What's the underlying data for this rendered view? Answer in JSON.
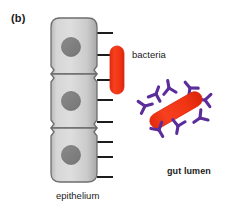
{
  "figure": {
    "panel_letter": "(b)",
    "width": 230,
    "height": 211,
    "background_color": "#FFFFFF"
  },
  "labels": {
    "panel": "(b)",
    "bacteria": "bacteria",
    "gut_lumen": "gut lumen",
    "epithelium": "epithelium"
  },
  "colors": {
    "cell_fill_light": "#E2E2E2",
    "cell_fill_mid": "#C9C9C9",
    "cell_fill_dark": "#AFAFAF",
    "cell_outline": "#6E6E6E",
    "nucleus": "#7E7E7E",
    "nucleus_outline": "#6A6A6A",
    "bacteria_red": "#F23A18",
    "bacteria_red_edge": "#E02A10",
    "antibody_purple": "#5B2D9B",
    "microvilli": "#1C1C1C",
    "text": "#1A1A1A"
  },
  "epithelium": {
    "description": "column of three stacked epithelial cells",
    "cell_count": 3,
    "column": {
      "x": 49,
      "y": 18,
      "width": 48,
      "height": 164
    },
    "cells": [
      {
        "index": 1,
        "y_top": 18,
        "y_bottom": 74,
        "nucleus": {
          "cx": 71,
          "cy": 47,
          "r": 9.5
        }
      },
      {
        "index": 2,
        "y_top": 74,
        "y_bottom": 128,
        "nucleus": {
          "cx": 71,
          "cy": 101,
          "r": 9.5
        }
      },
      {
        "index": 3,
        "y_top": 128,
        "y_bottom": 182,
        "nucleus": {
          "cx": 71,
          "cy": 155,
          "r": 9.5
        }
      }
    ],
    "microvilli": {
      "count": 8,
      "x_start": 97,
      "x_end": 113,
      "y_positions": [
        33,
        55,
        80,
        100,
        122,
        142,
        157,
        177
      ],
      "stroke_width": 2
    }
  },
  "adherent_bacterium": {
    "shape": "vertical rod / capsule",
    "x": 110,
    "y": 46,
    "width": 14,
    "height": 48,
    "rotation_deg": 0
  },
  "lumen_bacterium": {
    "shape": "diagonal rod / capsule",
    "cx": 176,
    "cy": 110,
    "length": 58,
    "thickness": 15,
    "rotation_deg": -30
  },
  "antibodies": {
    "count": 8,
    "shape": "Y-shaped immunoglobulin",
    "items": [
      {
        "cx": 145,
        "cy": 106,
        "rotation_deg": 255
      },
      {
        "cx": 156,
        "cy": 94,
        "rotation_deg": 200
      },
      {
        "cx": 169,
        "cy": 88,
        "rotation_deg": 170
      },
      {
        "cx": 190,
        "cy": 88,
        "rotation_deg": 140
      },
      {
        "cx": 205,
        "cy": 100,
        "rotation_deg": 95
      },
      {
        "cx": 200,
        "cy": 118,
        "rotation_deg": 55
      },
      {
        "cx": 178,
        "cy": 126,
        "rotation_deg": 10
      },
      {
        "cx": 159,
        "cy": 130,
        "rotation_deg": 330
      }
    ]
  }
}
